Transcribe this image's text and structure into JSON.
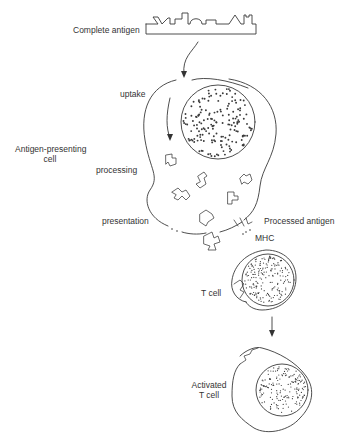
{
  "diagram": {
    "labels": {
      "complete_antigen": "Complete antigen",
      "uptake": "uptake",
      "antigen_presenting_cell_line1": "Antigen-presenting",
      "antigen_presenting_cell_line2": "cell",
      "processing": "processing",
      "presentation": "presentation",
      "processed_antigen": "Processed antigen",
      "mhc": "MHC",
      "t_cell": "T cell",
      "activated_t_cell_line1": "Activated",
      "activated_t_cell_line2": "T cell"
    },
    "stages": [
      {
        "id": "complete-antigen",
        "label": "Complete antigen"
      },
      {
        "id": "uptake",
        "label": "uptake"
      },
      {
        "id": "processing",
        "label": "processing"
      },
      {
        "id": "presentation",
        "label": "presentation"
      },
      {
        "id": "t-cell-recognition",
        "label": "T cell"
      },
      {
        "id": "activation",
        "label": "Activated T cell"
      }
    ],
    "colors": {
      "line": "#3a3a3a",
      "text": "#333333",
      "background": "#ffffff"
    }
  }
}
